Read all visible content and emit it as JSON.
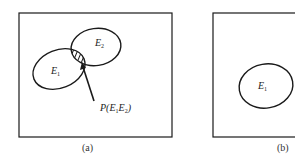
{
  "figure": {
    "panel_a": {
      "caption": "(a)",
      "set1_label": "E",
      "set1_sub": "1",
      "set2_label": "E",
      "set2_sub": "2",
      "annotation": {
        "prefix": "P(",
        "e1": "E",
        "e1_sub": "1",
        "e2": "E",
        "e2_sub": "2",
        "suffix": ")"
      }
    },
    "panel_b": {
      "caption": "(b)",
      "set1_label": "E",
      "set1_sub": "1"
    }
  },
  "colors": {
    "stroke": "#1a1a1a",
    "hatch": "#1a1a1a",
    "background": "#ffffff"
  }
}
